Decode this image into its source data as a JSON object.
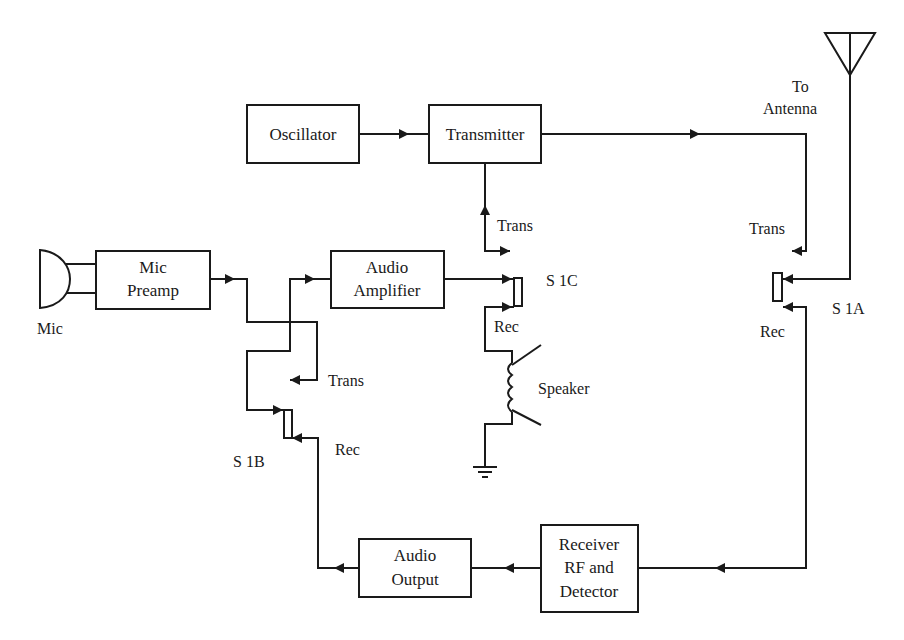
{
  "diagram": {
    "blocks": {
      "oscillator": [
        "Oscillator"
      ],
      "transmitter": [
        "Transmitter"
      ],
      "mic_preamp": [
        "Mic",
        "Preamp"
      ],
      "audio_amplifier": [
        "Audio",
        "Amplifier"
      ],
      "audio_output": [
        "Audio",
        "Output"
      ],
      "receiver": [
        "Receiver",
        "RF and",
        "Detector"
      ]
    },
    "labels": {
      "mic": "Mic",
      "to_antenna_1": "To",
      "to_antenna_2": "Antenna",
      "speaker": "Speaker",
      "s1a": "S 1A",
      "s1b": "S 1B",
      "s1c": "S 1C",
      "trans_s1a": "Trans",
      "rec_s1a": "Rec",
      "trans_s1b": "Trans",
      "rec_s1b": "Rec",
      "trans_s1c": "Trans",
      "rec_s1c": "Rec"
    },
    "icons": {
      "microphone": "microphone-icon",
      "antenna": "antenna-icon",
      "speaker": "speaker-coil-icon",
      "ground": "ground-icon"
    },
    "colors": {
      "line": "#1a1a1a",
      "background": "#ffffff"
    }
  }
}
